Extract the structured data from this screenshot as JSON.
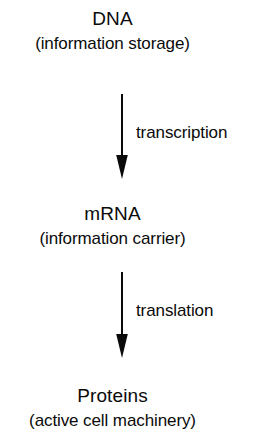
{
  "diagram": {
    "background_color": "#ffffff",
    "ink_color": "#0a0a0a",
    "stages": [
      {
        "id": "dna",
        "title": "DNA",
        "subtitle": "(information storage)"
      },
      {
        "id": "mrna",
        "title": "mRNA",
        "subtitle": "(information carrier)"
      },
      {
        "id": "proteins",
        "title": "Proteins",
        "subtitle": "(active cell machinery)"
      }
    ],
    "arrows": [
      {
        "id": "transcription",
        "label": "transcription",
        "from": "dna",
        "to": "mrna",
        "direction": "down"
      },
      {
        "id": "translation",
        "label": "translation",
        "from": "mrna",
        "to": "proteins",
        "direction": "down"
      }
    ]
  }
}
